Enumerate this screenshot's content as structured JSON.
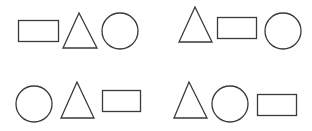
{
  "stroke_color": "#3a3a3a",
  "background": "#ffffff",
  "groups": [
    {
      "order": [
        "rectangle",
        "triangle",
        "circle"
      ],
      "rectangle": {
        "x": 18.5,
        "y": 20.5,
        "w": 40,
        "h": 21
      },
      "triangle": {
        "points": "79,13 63,48 97,48"
      },
      "circle": {
        "cx": 120,
        "cy": 31,
        "r": 18
      }
    },
    {
      "order": [
        "triangle",
        "rectangle",
        "circle"
      ],
      "triangle": {
        "points": "195,7 179,42 212,42"
      },
      "rectangle": {
        "x": 217.5,
        "y": 17.5,
        "w": 39,
        "h": 21
      },
      "circle": {
        "cx": 283,
        "cy": 31,
        "r": 18
      }
    },
    {
      "order": [
        "circle",
        "triangle",
        "rectangle"
      ],
      "circle": {
        "cx": 34,
        "cy": 104,
        "r": 18
      },
      "triangle": {
        "points": "77,82 61,118 94,118"
      },
      "rectangle": {
        "x": 102.5,
        "y": 90.5,
        "w": 38,
        "h": 21
      }
    },
    {
      "order": [
        "triangle",
        "circle",
        "rectangle"
      ],
      "triangle": {
        "points": "189,82 174,118 207,118"
      },
      "circle": {
        "cx": 230,
        "cy": 104,
        "r": 18
      },
      "rectangle": {
        "x": 257.5,
        "y": 94.5,
        "w": 39,
        "h": 21
      }
    }
  ]
}
